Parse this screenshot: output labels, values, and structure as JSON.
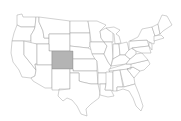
{
  "map": {
    "title": "United States",
    "highlighted_state": "Colorado",
    "colors": {
      "background": "#ffffff",
      "state_fill": "#ffffff",
      "state_border": "#9a9a9a",
      "highlight_fill": "#b4b4b4"
    },
    "states": [
      {
        "name": "Washington",
        "d": "M17,15 L22,14 L23,17 L36,17 L35,27 L21,27 L17,25 Z"
      },
      {
        "name": "Oregon",
        "d": "M17,25 L21,27 L35,27 L34,30 L31,35 L31,41 L12,41 L14,33 Z"
      },
      {
        "name": "California",
        "d": "M12,41 L24,41 L24,55 L36,70 L35,76 L31,78 L22,77 L19,70 L13,62 L11,53 Z"
      },
      {
        "name": "Idaho",
        "d": "M36,17 L39,17 L39,22 L43,31 L44,38 L49,38 L49,44 L31,44 L31,35 L34,30 L35,27 Z"
      },
      {
        "name": "Nevada",
        "d": "M24,41 L37,44 L37,64 L35,64 L36,70 L24,55 Z"
      },
      {
        "name": "Montana",
        "d": "M39,17 L70,21 L70,34 L49,34 L49,38 L44,38 L43,31 L39,22 Z"
      },
      {
        "name": "Wyoming",
        "d": "M49,34 L70,34 L70,51 L49,51 Z"
      },
      {
        "name": "Utah",
        "d": "M37,44 L49,44 L49,51 L52,51 L52,65 L37,65 Z"
      },
      {
        "name": "Arizona",
        "d": "M37,65 L52,65 L52,88 L45,88 L33,81 L31,78 L35,76 L36,70 L35,64 Z"
      },
      {
        "name": "Colorado",
        "d": "M52,51 L73,51 L73,69 L52,69 Z",
        "highlight": true
      },
      {
        "name": "New Mexico",
        "d": "M52,69 L70,69 L70,89 L59,89 L59,90 L52,90 L52,88 Z"
      },
      {
        "name": "North Dakota",
        "d": "M70,21 L88,21 L90,33 L70,33 Z"
      },
      {
        "name": "South Dakota",
        "d": "M70,33 L90,33 L90,46 L88,48 L70,46 Z"
      },
      {
        "name": "Nebraska",
        "d": "M70,46 L88,48 L92,50 L95,59 L73,59 L73,51 L70,51 Z"
      },
      {
        "name": "Kansas",
        "d": "M73,59 L95,59 L97,61 L97,71 L73,71 Z"
      },
      {
        "name": "Oklahoma",
        "d": "M70,69 L73,69 L73,71 L97,71 L98,84 L91,84 L82,82 L79,81 L79,73 L70,73 Z"
      },
      {
        "name": "Texas",
        "d": "M70,73 L79,73 L79,81 L82,82 L91,84 L98,84 L100,93 L99,98 L91,104 L86,109 L87,116 L81,114 L77,106 L72,100 L67,98 L63,101 L58,96 L59,90 L70,89 Z"
      },
      {
        "name": "Minnesota",
        "d": "M88,21 L97,21 L106,25 L100,31 L101,38 L104,42 L91,42 L90,33 Z"
      },
      {
        "name": "Iowa",
        "d": "M90,42 L104,42 L107,46 L104,54 L92,54 L90,46 Z"
      },
      {
        "name": "Missouri",
        "d": "M92,54 L104,54 L108,62 L111,66 L109,73 L98,73 L97,61 L95,59 Z"
      },
      {
        "name": "Arkansas",
        "d": "M98,73 L109,73 L109,75 L106,84 L100,84 L98,84 Z"
      },
      {
        "name": "Louisiana",
        "d": "M100,84 L106,84 L105,90 L111,90 L114,96 L108,97 L100,95 L100,93 Z"
      },
      {
        "name": "Wisconsin",
        "d": "M100,31 L106,28 L110,31 L113,31 L113,42 L104,42 L101,38 Z"
      },
      {
        "name": "Illinois",
        "d": "M104,42 L112,42 L113,57 L111,66 L108,62 L104,54 L107,46 Z"
      },
      {
        "name": "Michigan",
        "d": "M106,28 L114,27 L120,30 L116,34 L119,36 L121,43 L115,44 L114,34 L110,31 Z"
      },
      {
        "name": "Indiana",
        "d": "M113,44 L119,44 L120,55 L113,59 Z"
      },
      {
        "name": "Ohio",
        "d": "M119,44 L127,42 L129,50 L125,55 L120,55 Z"
      },
      {
        "name": "Kentucky",
        "d": "M113,59 L120,55 L125,55 L130,59 L126,64 L111,66 Z"
      },
      {
        "name": "Tennessee",
        "d": "M109,69 L126,64 L136,64 L131,69 L109,71 Z"
      },
      {
        "name": "Mississippi",
        "d": "M106,72 L113,72 L113,91 L111,90 L105,90 L106,84 Z"
      },
      {
        "name": "Alabama",
        "d": "M113,71 L120,70 L123,87 L117,87 L117,91 L113,91 Z"
      },
      {
        "name": "Georgia",
        "d": "M120,70 L127,69 L134,78 L135,84 L124,87 Z"
      },
      {
        "name": "Florida",
        "d": "M117,87 L124,87 L135,84 L139,94 L143,106 L141,111 L136,106 L133,98 L129,91 L123,89 L117,91 Z"
      },
      {
        "name": "South Carolina",
        "d": "M127,69 L133,67 L140,71 L134,78 Z"
      },
      {
        "name": "North Carolina",
        "d": "M131,64 L148,60 L150,64 L144,70 L140,71 L133,67 L127,69 L131,69 Z"
      },
      {
        "name": "Virginia",
        "d": "M126,64 L130,59 L136,54 L142,53 L148,60 L131,64 Z"
      },
      {
        "name": "West Virginia",
        "d": "M127,52 L131,48 L136,51 L136,54 L130,59 L125,55 Z"
      },
      {
        "name": "Pennsylvania",
        "d": "M129,41 L147,40 L149,46 L132,48 L129,50 Z"
      },
      {
        "name": "New York",
        "d": "M130,41 L138,37 L142,29 L152,27 L155,36 L154,44 L149,42 L147,40 Z"
      },
      {
        "name": "Maryland/Delaware",
        "d": "M136,51 L132,48 L149,46 L151,53 L146,53 L142,53 Z"
      },
      {
        "name": "New Jersey",
        "d": "M149,42 L152,44 L152,50 L149,46 Z"
      },
      {
        "name": "Vermont/NH",
        "d": "M152,27 L158,24 L160,34 L155,36 Z"
      },
      {
        "name": "Massachusetts/CT/RI",
        "d": "M154,36 L161,35 L164,38 L154,41 Z"
      },
      {
        "name": "Maine",
        "d": "M158,24 L162,15 L167,16 L172,25 L163,31 L160,34 Z"
      }
    ]
  }
}
